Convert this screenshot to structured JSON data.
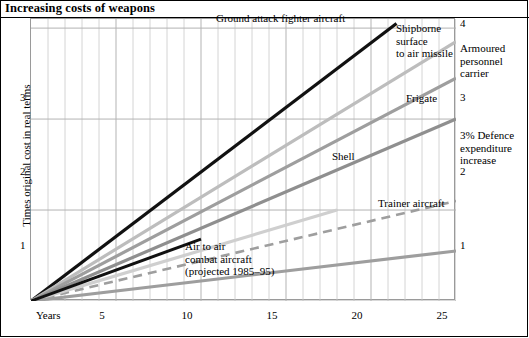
{
  "title": "Increasing costs of weapons",
  "axes": {
    "y_title": "Times original cost in real terms",
    "x_title": "Years",
    "y_ticks": [
      "1",
      "2",
      "3",
      "4"
    ],
    "x_ticks": [
      "5",
      "10",
      "15",
      "20",
      "25"
    ]
  },
  "annotations": {
    "ground_attack": "Ground attack fighter aircraft",
    "shipborne": "Shipborne\nsurface\nto air missile",
    "armoured": "Armoured\npersonnel\ncarrier",
    "frigate": "Frigate",
    "defence_increase": "3% Defence\nexpenditure\nincrease",
    "shell": "Shell",
    "trainer": "Trainer aircraft",
    "air_to_air": "Air to air\ncombat aircraft\n(projected 1985–95)"
  },
  "colors": {
    "black": "#111111",
    "dark_gray": "#8f8f8f",
    "mid_gray": "#9e9e9e",
    "light_gray": "#bdbdbd",
    "pale_gray": "#cfcfcf",
    "grid": "#c9c9c9",
    "axis": "#9a9a9a"
  },
  "chart_data": {
    "type": "line",
    "title": "Increasing costs of weapons",
    "xlabel": "Years",
    "ylabel": "Times original cost in real terms",
    "xlim": [
      0,
      25
    ],
    "ylim": [
      1,
      4.1
    ],
    "grid": true,
    "legend": "inline-annotations",
    "x_ticks": [
      5,
      10,
      15,
      20,
      25
    ],
    "y_ticks": [
      1,
      2,
      3,
      4
    ],
    "series": [
      {
        "name": "Ground attack fighter aircraft",
        "color": "#111111",
        "width": 3.2,
        "dash": false,
        "points": [
          [
            0,
            1
          ],
          [
            21.5,
            4.05
          ]
        ]
      },
      {
        "name": "Shipborne surface to air missile",
        "color": "#bdbdbd",
        "width": 3.2,
        "dash": false,
        "points": [
          [
            0,
            1
          ],
          [
            25,
            3.85
          ]
        ]
      },
      {
        "name": "Armoured personnel carrier",
        "color": "#9e9e9e",
        "width": 3.2,
        "dash": false,
        "points": [
          [
            0,
            1
          ],
          [
            25,
            3.45
          ]
        ]
      },
      {
        "name": "Frigate",
        "color": "#8f8f8f",
        "width": 3.2,
        "dash": false,
        "points": [
          [
            0,
            1
          ],
          [
            25,
            3.0
          ]
        ]
      },
      {
        "name": "3% Defence expenditure increase",
        "color": "#9e9e9e",
        "width": 2.6,
        "dash": true,
        "points": [
          [
            0,
            1
          ],
          [
            25,
            2.1
          ]
        ]
      },
      {
        "name": "Shell",
        "color": "#cfcfcf",
        "width": 3.2,
        "dash": false,
        "points": [
          [
            0,
            1
          ],
          [
            18,
            2.0
          ]
        ]
      },
      {
        "name": "Trainer aircraft",
        "color": "#9e9e9e",
        "width": 3.2,
        "dash": false,
        "points": [
          [
            0,
            1
          ],
          [
            25,
            1.55
          ]
        ]
      },
      {
        "name": "Air to air combat aircraft (projected 1985–95)",
        "color": "#111111",
        "width": 3.0,
        "dash": false,
        "points": [
          [
            0,
            1
          ],
          [
            10,
            1.68
          ]
        ]
      }
    ]
  }
}
